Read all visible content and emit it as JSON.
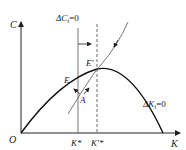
{
  "diagram": {
    "axes": {
      "y_label": "C",
      "x_label": "K",
      "origin_label": "O"
    },
    "curves": {
      "delta_c_label": "ΔC",
      "delta_c_sub": "i",
      "delta_c_eq": "=0",
      "delta_k_label": "ΔK",
      "delta_k_sub": "i",
      "delta_k_eq": "=0"
    },
    "points": {
      "E": "E",
      "E_prime": "E'",
      "A": "A"
    },
    "ticks": {
      "k_star": "K*",
      "k_prime_star": "K'*"
    },
    "colors": {
      "line": "#222222",
      "curve": "#111111",
      "dashed": "#444444"
    }
  }
}
